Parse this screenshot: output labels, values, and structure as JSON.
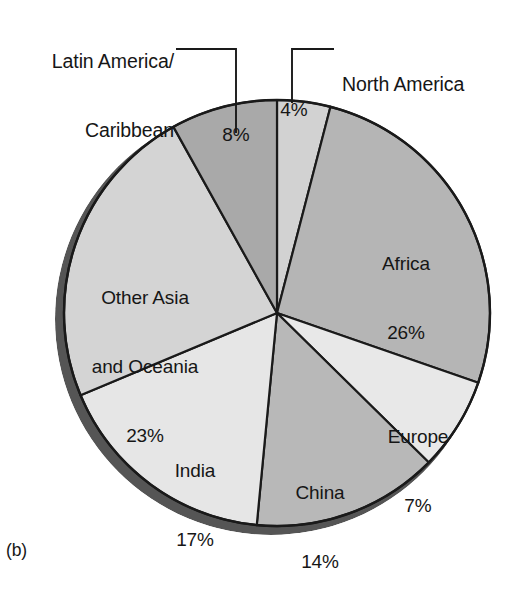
{
  "figure": {
    "panel_letter": "(b)",
    "background_color": "#ffffff"
  },
  "chart_data": {
    "type": "pie",
    "title": "",
    "subtitle": "",
    "xlabel": "",
    "ylabel": "",
    "legend_position": "none",
    "grid": false,
    "value_unit": "%",
    "total_labeled": "99%",
    "categories": [
      "North America",
      "Africa",
      "Europe",
      "China",
      "India",
      "Other Asia and Oceania",
      "Latin America/Caribbean"
    ],
    "values": [
      4,
      26,
      7,
      14,
      17,
      23,
      8
    ],
    "slices": [
      {
        "name": "North America",
        "label": "North America",
        "value": 4,
        "value_label": "4%",
        "color": "#d2d2d2",
        "label_placement": "callout",
        "start_angle_deg": 0,
        "end_angle_deg": 14.4
      },
      {
        "name": "Africa",
        "label": "Africa",
        "value": 26,
        "value_label": "26%",
        "color": "#b5b5b5",
        "label_placement": "inside",
        "start_angle_deg": 14.4,
        "end_angle_deg": 108.0
      },
      {
        "name": "Europe",
        "label": "Europe",
        "value": 7,
        "value_label": "7%",
        "color": "#e8e8e8",
        "label_placement": "inside",
        "start_angle_deg": 108.0,
        "end_angle_deg": 133.2
      },
      {
        "name": "China",
        "label": "China",
        "value": 14,
        "value_label": "14%",
        "color": "#b8b8b8",
        "label_placement": "inside",
        "start_angle_deg": 133.2,
        "end_angle_deg": 183.6
      },
      {
        "name": "India",
        "label": "India",
        "value": 17,
        "value_label": "17%",
        "color": "#e6e6e6",
        "label_placement": "inside",
        "start_angle_deg": 183.6,
        "end_angle_deg": 244.8
      },
      {
        "name": "Other Asia and Oceania",
        "label": "Other Asia and Oceania",
        "value": 23,
        "value_label": "23%",
        "color": "#d4d4d4",
        "label_placement": "inside",
        "start_angle_deg": 244.8,
        "end_angle_deg": 327.6
      },
      {
        "name": "Latin America/Caribbean",
        "label": "Latin America/Caribbean",
        "value": 8,
        "value_label": "8%",
        "color": "#a9a9a9",
        "label_placement": "callout",
        "start_angle_deg": 327.6,
        "end_angle_deg": 360.0
      }
    ],
    "colors": {
      "outline": "#1a1a1a",
      "shadow_rim": "#555555",
      "text": "#161616"
    }
  },
  "labels": {
    "latin_america": {
      "line1": "Latin America/",
      "line2": "Caribbean",
      "percent": "8%"
    },
    "north_america": {
      "line1": "North America",
      "percent": "4%"
    },
    "africa": {
      "name": "Africa",
      "percent": "26%"
    },
    "europe": {
      "name": "Europe",
      "percent": "7%"
    },
    "china": {
      "name": "China",
      "percent": "14%"
    },
    "india": {
      "name": "India",
      "percent": "17%"
    },
    "other_asia": {
      "line1": "Other Asia",
      "line2": "and Oceania",
      "percent": "23%"
    }
  }
}
